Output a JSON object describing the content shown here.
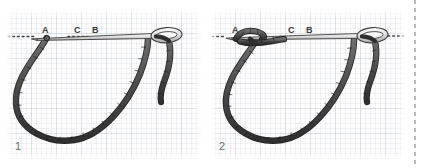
{
  "figure": {
    "type": "instructional-stitch-diagram",
    "background": "graph-paper",
    "colors": {
      "thread": "#5a5a5a",
      "thread_outline": "#2e2e2e",
      "needle": "#d8d8d8",
      "needle_outline": "#3c3c3c",
      "fabric_line": "#3a3a3a",
      "grid": "#b0bac4",
      "label_text": "#3a3a3a",
      "step_number": "#6e6e6e",
      "page_divider": "#b9b9b9",
      "paper": "#fdfdfd"
    },
    "panels": [
      {
        "step_number": "1",
        "caption": "",
        "labels": [
          {
            "text": "A",
            "x": 36,
            "y": 18
          },
          {
            "text": "C",
            "x": 68,
            "y": 18
          },
          {
            "text": "B",
            "x": 86,
            "y": 18
          }
        ],
        "fabric_line_label": "fabric surface",
        "elements": [
          "needle emerging at A pointing left",
          "thread loop hanging below between A and B",
          "needle eye at right with thread tail"
        ]
      },
      {
        "step_number": "2",
        "caption": "",
        "labels": [
          {
            "text": "A",
            "x": 22,
            "y": 18
          },
          {
            "text": "C",
            "x": 78,
            "y": 18
          },
          {
            "text": "B",
            "x": 96,
            "y": 18
          }
        ],
        "fabric_line_label": "fabric surface",
        "elements": [
          "thread wrapped once around needle near A forming knot",
          "thread loop hanging below between A and B",
          "needle eye at right with thread tail"
        ]
      }
    ]
  }
}
